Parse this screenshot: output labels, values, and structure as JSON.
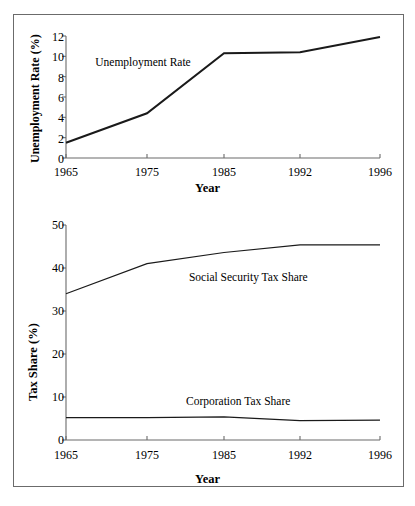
{
  "figure": {
    "background": "#ffffff",
    "border_color": "#6b6b6b",
    "line_color": "#1a1a1a",
    "axis_color": "#6b6b6b"
  },
  "chart_data": [
    {
      "id": "unemployment",
      "type": "line",
      "title": "",
      "xlabel": "Year",
      "ylabel": "Unemployment Rate (%)",
      "categories": [
        "1965",
        "1975",
        "1985",
        "1992",
        "1996"
      ],
      "x_positions": [
        1965,
        1975,
        1985,
        1992,
        1996
      ],
      "xlim": [
        1965,
        1996
      ],
      "ylim": [
        0,
        12
      ],
      "yticks": [
        "0",
        "2",
        "4",
        "6",
        "8",
        "10",
        "12"
      ],
      "ytick_values": [
        0,
        2,
        4,
        6,
        8,
        10,
        12
      ],
      "grid": false,
      "legend_position": "inline-annotation",
      "series": [
        {
          "name": "Unemployment Rate",
          "values": [
            1.5,
            4.4,
            10.3,
            10.4,
            11.9
          ],
          "label_x": 1972.6,
          "label_y": 9.4
        }
      ]
    },
    {
      "id": "tax_share",
      "type": "line",
      "title": "",
      "xlabel": "Year",
      "ylabel": "Tax Share (%)",
      "categories": [
        "1965",
        "1975",
        "1985",
        "1992",
        "1996"
      ],
      "x_positions": [
        1965,
        1975,
        1985,
        1992,
        1996
      ],
      "xlim": [
        1965,
        1996
      ],
      "ylim": [
        0,
        50
      ],
      "yticks": [
        "0",
        "10",
        "20",
        "30",
        "40",
        "50"
      ],
      "ytick_values": [
        0,
        10,
        20,
        30,
        40,
        50
      ],
      "grid": false,
      "legend_position": "inline-annotation",
      "series": [
        {
          "name": "Social Security Tax Share",
          "values": [
            34.0,
            41.0,
            43.6,
            45.4,
            45.4
          ],
          "label_x": 1983.0,
          "label_y": 38.0
        },
        {
          "name": "Corporation Tax Share",
          "values": [
            5.2,
            5.2,
            5.4,
            4.5,
            4.6
          ],
          "label_x": 1982.0,
          "label_y": 9.0
        }
      ]
    }
  ],
  "panels": {
    "unemployment": {
      "ylabel": "Unemployment Rate (%)",
      "xlabel": "Year",
      "series_label_0": "Unemployment Rate",
      "ytick_0": "0",
      "ytick_1": "2",
      "ytick_2": "4",
      "ytick_3": "6",
      "ytick_4": "8",
      "ytick_5": "10",
      "ytick_6": "12",
      "xtick_0": "1965",
      "xtick_1": "1975",
      "xtick_2": "1985",
      "xtick_3": "1992",
      "xtick_4": "1996"
    },
    "tax_share": {
      "ylabel": "Tax Share (%)",
      "xlabel": "Year",
      "series_label_0": "Social Security Tax Share",
      "series_label_1": "Corporation Tax Share",
      "ytick_0": "0",
      "ytick_1": "10",
      "ytick_2": "20",
      "ytick_3": "30",
      "ytick_4": "40",
      "ytick_5": "50",
      "xtick_0": "1965",
      "xtick_1": "1975",
      "xtick_2": "1985",
      "xtick_3": "1992",
      "xtick_4": "1996"
    }
  }
}
